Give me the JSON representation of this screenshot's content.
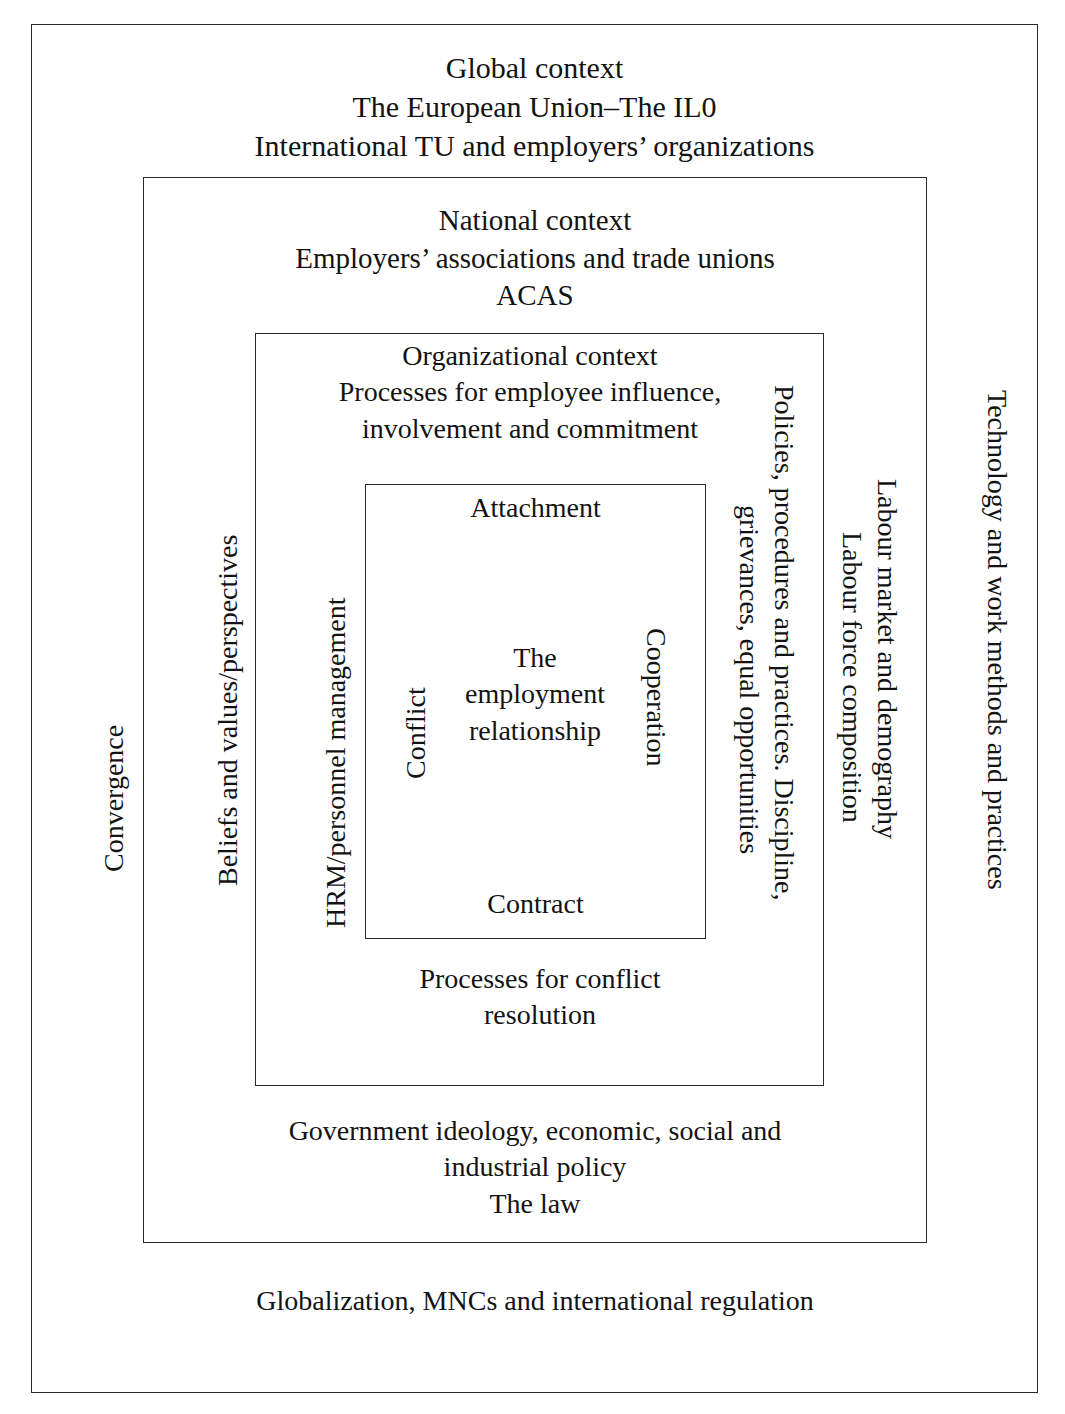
{
  "diagram": {
    "layers": {
      "global": {
        "heading": "Global context\nThe European Union–The IL0\nInternational TU and employers’ organizations",
        "bottom_note": "Globalization, MNCs and international regulation",
        "left_label": "Convergence",
        "right_label": "Technology and work methods and practices"
      },
      "national": {
        "heading": "National context\nEmployers’ associations and trade unions\nACAS",
        "bottom_note": "Government ideology, economic, social and\nindustrial policy\nThe law",
        "left_label": "Beliefs and values/perspectives",
        "right_label_1": "Labour market and demography",
        "right_label_2": "Labour force composition"
      },
      "organizational": {
        "heading": "Organizational context\nProcesses for employee influence,\ninvolvement and commitment",
        "bottom_note": "Processes for conflict\nresolution",
        "left_label": "HRM/personnel management",
        "right_label_1": "Policies, procedures and practices. Discipline,",
        "right_label_2": "grievances, equal opportunities"
      },
      "employment": {
        "top_label": "Attachment",
        "bottom_label": "Contract",
        "left_label": "Conflict",
        "right_label": "Cooperation",
        "core": "The\nemployment\nrelationship"
      }
    },
    "colors": {
      "border": "#2a2a2a",
      "text": "#131313",
      "background": "#ffffff"
    }
  }
}
